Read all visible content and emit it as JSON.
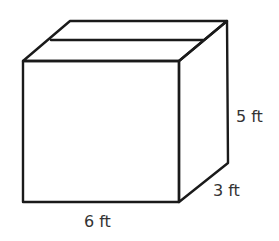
{
  "diagram": {
    "type": "rectangular-prism",
    "labels": {
      "length": "6 ft",
      "width": "3 ft",
      "height": "5 ft"
    },
    "colors": {
      "stroke": "#1a1a1a",
      "text": "#333333",
      "background": "#ffffff"
    }
  }
}
